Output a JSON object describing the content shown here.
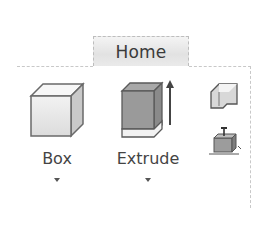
{
  "ribbon": {
    "tabs": [
      {
        "label": "Home",
        "active": true
      }
    ],
    "buttons": [
      {
        "label": "Box",
        "icon": "box-icon",
        "has_dropdown": true
      },
      {
        "label": "Extrude",
        "icon": "extrude-icon",
        "has_dropdown": true
      }
    ],
    "small_buttons": [
      {
        "icon": "sheet-metal-icon"
      },
      {
        "icon": "move-pull-icon"
      }
    ]
  }
}
